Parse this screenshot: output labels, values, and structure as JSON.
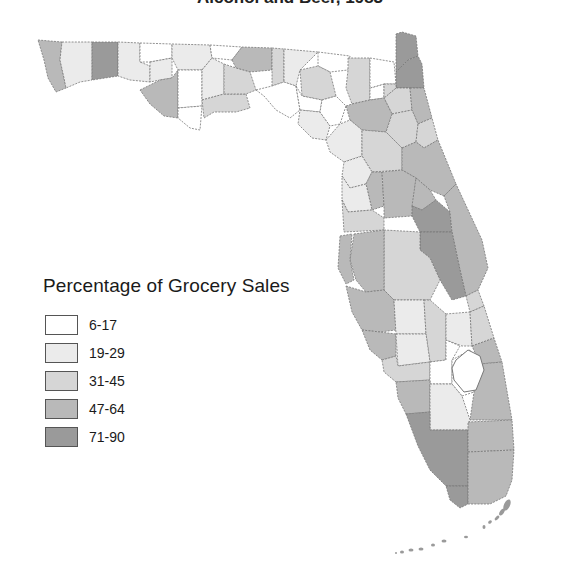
{
  "title": "Alcohol and Beer, 1983",
  "legend": {
    "title": "Percentage of Grocery Sales",
    "items": [
      {
        "label": "6-17",
        "color": "#ffffff"
      },
      {
        "label": "19-29",
        "color": "#ebebeb"
      },
      {
        "label": "31-45",
        "color": "#d6d6d6"
      },
      {
        "label": "47-64",
        "color": "#b9b9b9"
      },
      {
        "label": "71-90",
        "color": "#9a9a9a"
      }
    ]
  },
  "map": {
    "region": "Florida",
    "unit": "county",
    "shading": "grayscale choropleth"
  }
}
